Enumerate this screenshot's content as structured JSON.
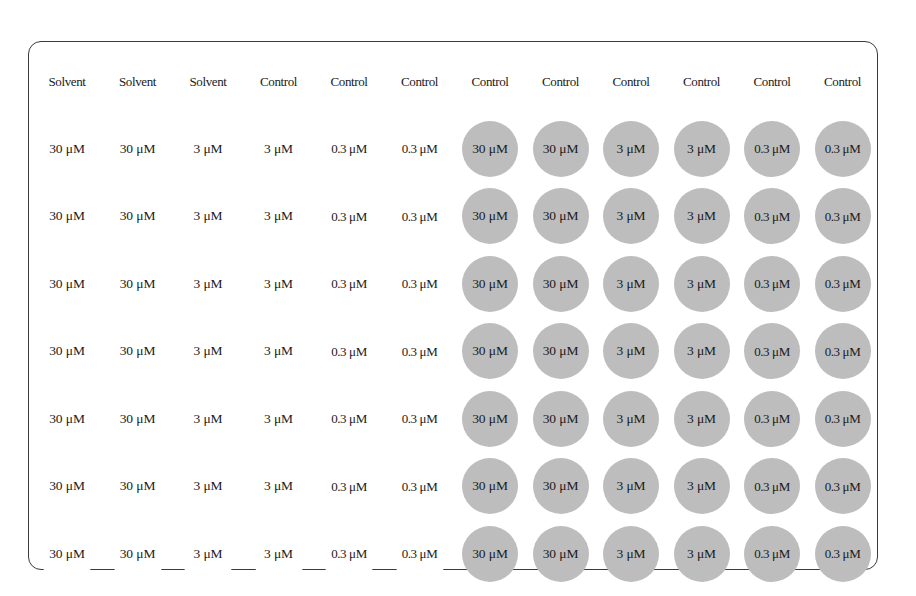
{
  "figure": {
    "name": "96-well-plate-layout",
    "rows": 8,
    "columns": 12,
    "colors": {
      "shaded_well_fill": "#bdbdbd",
      "unshaded_well_fill": "#ffffff",
      "well_stroke": "#333333",
      "plate_stroke": "#3a3a3a",
      "label_text": "#1a1a1a",
      "background": "#ffffff"
    },
    "geometry": {
      "plate_left": 28,
      "plate_top": 41,
      "plate_width": 850,
      "plate_height": 529,
      "plate_corner_radius": 13,
      "well_diameter": 56,
      "column_pitch": 70.5,
      "row_pitch": 67.5,
      "first_well_center_x": 66,
      "first_well_center_y": 80
    }
  },
  "legend": {
    "solvent_label": "Solvent",
    "control_label": "Control",
    "dose_high": "30 μM",
    "dose_mid": "3 μM",
    "dose_low": "0.3 μM"
  },
  "plate": {
    "rows": [
      {
        "row_index": 1,
        "wells": [
          {
            "label": "Solvent",
            "shaded": false
          },
          {
            "label": "Solvent",
            "shaded": false
          },
          {
            "label": "Solvent",
            "shaded": false
          },
          {
            "label": "Control",
            "shaded": false
          },
          {
            "label": "Control",
            "shaded": false
          },
          {
            "label": "Control",
            "shaded": false
          },
          {
            "label": "Control",
            "shaded": false
          },
          {
            "label": "Control",
            "shaded": false
          },
          {
            "label": "Control",
            "shaded": false
          },
          {
            "label": "Control",
            "shaded": false
          },
          {
            "label": "Control",
            "shaded": false
          },
          {
            "label": "Control",
            "shaded": false
          }
        ]
      },
      {
        "row_index": 2,
        "wells": [
          {
            "label": "30 μM",
            "shaded": false
          },
          {
            "label": "30 μM",
            "shaded": false
          },
          {
            "label": "3 μM",
            "shaded": false
          },
          {
            "label": "3 μM",
            "shaded": false
          },
          {
            "label": "0.3 μM",
            "shaded": false
          },
          {
            "label": "0.3 μM",
            "shaded": false
          },
          {
            "label": "30 μM",
            "shaded": true
          },
          {
            "label": "30 μM",
            "shaded": true
          },
          {
            "label": "3 μM",
            "shaded": true
          },
          {
            "label": "3 μM",
            "shaded": true
          },
          {
            "label": "0.3 μM",
            "shaded": true
          },
          {
            "label": "0.3 μM",
            "shaded": true
          }
        ]
      },
      {
        "row_index": 3,
        "wells": [
          {
            "label": "30 μM",
            "shaded": false
          },
          {
            "label": "30 μM",
            "shaded": false
          },
          {
            "label": "3 μM",
            "shaded": false
          },
          {
            "label": "3 μM",
            "shaded": false
          },
          {
            "label": "0.3 μM",
            "shaded": false
          },
          {
            "label": "0.3 μM",
            "shaded": false
          },
          {
            "label": "30 μM",
            "shaded": true
          },
          {
            "label": "30 μM",
            "shaded": true
          },
          {
            "label": "3 μM",
            "shaded": true
          },
          {
            "label": "3 μM",
            "shaded": true
          },
          {
            "label": "0.3 μM",
            "shaded": true
          },
          {
            "label": "0.3 μM",
            "shaded": true
          }
        ]
      },
      {
        "row_index": 4,
        "wells": [
          {
            "label": "30 μM",
            "shaded": false
          },
          {
            "label": "30 μM",
            "shaded": false
          },
          {
            "label": "3 μM",
            "shaded": false
          },
          {
            "label": "3 μM",
            "shaded": false
          },
          {
            "label": "0.3 μM",
            "shaded": false
          },
          {
            "label": "0.3 μM",
            "shaded": false
          },
          {
            "label": "30 μM",
            "shaded": true
          },
          {
            "label": "30 μM",
            "shaded": true
          },
          {
            "label": "3 μM",
            "shaded": true
          },
          {
            "label": "3 μM",
            "shaded": true
          },
          {
            "label": "0.3 μM",
            "shaded": true
          },
          {
            "label": "0.3 μM",
            "shaded": true
          }
        ]
      },
      {
        "row_index": 5,
        "wells": [
          {
            "label": "30 μM",
            "shaded": false
          },
          {
            "label": "30 μM",
            "shaded": false
          },
          {
            "label": "3 μM",
            "shaded": false
          },
          {
            "label": "3 μM",
            "shaded": false
          },
          {
            "label": "0.3 μM",
            "shaded": false
          },
          {
            "label": "0.3 μM",
            "shaded": false
          },
          {
            "label": "30 μM",
            "shaded": true
          },
          {
            "label": "30 μM",
            "shaded": true
          },
          {
            "label": "3 μM",
            "shaded": true
          },
          {
            "label": "3 μM",
            "shaded": true
          },
          {
            "label": "0.3 μM",
            "shaded": true
          },
          {
            "label": "0.3 μM",
            "shaded": true
          }
        ]
      },
      {
        "row_index": 6,
        "wells": [
          {
            "label": "30 μM",
            "shaded": false
          },
          {
            "label": "30 μM",
            "shaded": false
          },
          {
            "label": "3 μM",
            "shaded": false
          },
          {
            "label": "3 μM",
            "shaded": false
          },
          {
            "label": "0.3 μM",
            "shaded": false
          },
          {
            "label": "0.3 μM",
            "shaded": false
          },
          {
            "label": "30 μM",
            "shaded": true
          },
          {
            "label": "30 μM",
            "shaded": true
          },
          {
            "label": "3 μM",
            "shaded": true
          },
          {
            "label": "3 μM",
            "shaded": true
          },
          {
            "label": "0.3 μM",
            "shaded": true
          },
          {
            "label": "0.3 μM",
            "shaded": true
          }
        ]
      },
      {
        "row_index": 7,
        "wells": [
          {
            "label": "30 μM",
            "shaded": false
          },
          {
            "label": "30 μM",
            "shaded": false
          },
          {
            "label": "3 μM",
            "shaded": false
          },
          {
            "label": "3 μM",
            "shaded": false
          },
          {
            "label": "0.3 μM",
            "shaded": false
          },
          {
            "label": "0.3 μM",
            "shaded": false
          },
          {
            "label": "30 μM",
            "shaded": true
          },
          {
            "label": "30 μM",
            "shaded": true
          },
          {
            "label": "3 μM",
            "shaded": true
          },
          {
            "label": "3 μM",
            "shaded": true
          },
          {
            "label": "0.3 μM",
            "shaded": true
          },
          {
            "label": "0.3 μM",
            "shaded": true
          }
        ]
      },
      {
        "row_index": 8,
        "wells": [
          {
            "label": "30 μM",
            "shaded": false
          },
          {
            "label": "30 μM",
            "shaded": false
          },
          {
            "label": "3 μM",
            "shaded": false
          },
          {
            "label": "3 μM",
            "shaded": false
          },
          {
            "label": "0.3 μM",
            "shaded": false
          },
          {
            "label": "0.3 μM",
            "shaded": false
          },
          {
            "label": "30 μM",
            "shaded": true
          },
          {
            "label": "30 μM",
            "shaded": true
          },
          {
            "label": "3 μM",
            "shaded": true
          },
          {
            "label": "3 μM",
            "shaded": true
          },
          {
            "label": "0.3 μM",
            "shaded": true
          },
          {
            "label": "0.3 μM",
            "shaded": true
          }
        ]
      }
    ]
  }
}
